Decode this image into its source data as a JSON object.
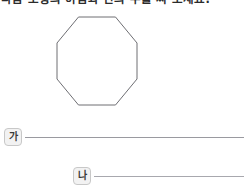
{
  "document": {
    "question": "다음 도형의 이름과 변의 수를 써 보세요.",
    "shape": {
      "name": "octagon",
      "sides": 8,
      "fill": "#ffffff",
      "stroke": "#6e6e73",
      "stroke_width": 1
    },
    "answers": [
      {
        "label": "가",
        "value": "",
        "placeholder": ""
      },
      {
        "label": "나",
        "value": "",
        "placeholder": ""
      }
    ]
  }
}
